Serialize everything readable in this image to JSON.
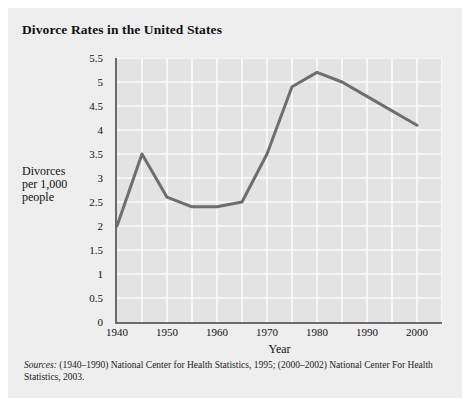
{
  "card": {
    "title": "Divorce Rates in the United States"
  },
  "source": {
    "label": "Sources:",
    "text": " (1940–1990) National Center for Health Statistics, 1995; (2000–2002) National Center For Health Statistics, 2003."
  },
  "axis": {
    "y_title_lines": [
      "Divorces",
      "per 1,000",
      "people"
    ],
    "x_title": "Year"
  },
  "colors": {
    "card_background": "#eeeeee",
    "plot_background": "#e3e3e3",
    "top_rule": "#5e5e5e",
    "axis": "#6b6b6b",
    "gridline": "#fbfbfb",
    "series_line": "#6e6e6e",
    "text": "#111111"
  },
  "chart_data": {
    "type": "line",
    "title": "Divorce Rates in the United States",
    "xlabel": "Year",
    "ylabel": "Divorces per 1,000 people",
    "xlim": [
      1940,
      2005
    ],
    "ylim": [
      0,
      5.5
    ],
    "ytick_step": 0.5,
    "yticks": [
      0,
      0.5,
      1,
      1.5,
      2,
      2.5,
      3,
      3.5,
      4,
      4.5,
      5,
      5.5
    ],
    "ytick_labels": [
      "0",
      "0.5",
      "1",
      "1.5",
      "2",
      "2.5",
      "3",
      "3.5",
      "4",
      "4.5",
      "5",
      "5.5"
    ],
    "xticks": [
      1940,
      1950,
      1960,
      1970,
      1980,
      1990,
      2000
    ],
    "xtick_labels": [
      "1940",
      "1950",
      "1960",
      "1970",
      "1980",
      "1990",
      "2000"
    ],
    "x_minor_step": 5,
    "grid": true,
    "grid_color": "#fbfbfb",
    "legend": false,
    "series": [
      {
        "name": "Divorces per 1,000 people",
        "color": "#6e6e6e",
        "x": [
          1940,
          1945,
          1950,
          1955,
          1960,
          1965,
          1970,
          1975,
          1980,
          1985,
          1990,
          2000
        ],
        "values": [
          2.0,
          3.5,
          2.6,
          2.4,
          2.4,
          2.5,
          3.5,
          4.9,
          5.2,
          5.0,
          4.7,
          4.1
        ]
      }
    ]
  }
}
